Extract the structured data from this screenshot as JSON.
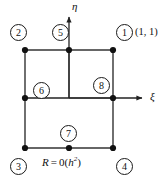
{
  "figure": {
    "name": "bilinear-quadrilateral-element-node-numbering",
    "canvas": {
      "width": 163,
      "height": 183
    },
    "colors": {
      "stroke": "#333333",
      "node_fill": "#111111",
      "circle_stroke": "#1a1a1a",
      "text": "#111111",
      "background": "#ffffff"
    },
    "axes": {
      "horizontal": {
        "label": "ξ",
        "name": "xi-axis",
        "y": 98,
        "x_start": 25,
        "x_end": 146,
        "label_x": 151,
        "label_y": 92
      },
      "vertical": {
        "label": "η",
        "name": "eta-axis",
        "x": 69,
        "y_start": 98,
        "y_end": 13,
        "label_x": 72,
        "label_y": 1
      }
    },
    "outer_square": {
      "left": 25,
      "top": 50,
      "right": 113,
      "bottom": 148
    },
    "inner_lines": {
      "vertical_segment": {
        "x": 69,
        "y_top": 50,
        "y_bottom": 98
      },
      "horizontal_segment": {
        "y": 98,
        "x_left": 69,
        "x_right": 113
      }
    },
    "nodes": [
      {
        "id": "1",
        "label": "1",
        "cx": 113,
        "cy": 50,
        "circle_x": 116,
        "circle_y": 24
      },
      {
        "id": "2",
        "label": "2",
        "cx": 25,
        "cy": 50,
        "circle_x": 10,
        "circle_y": 24
      },
      {
        "id": "3",
        "label": "3",
        "cx": 25,
        "cy": 148,
        "circle_x": 10,
        "circle_y": 158
      },
      {
        "id": "4",
        "label": "4",
        "cx": 113,
        "cy": 148,
        "circle_x": 116,
        "circle_y": 158
      },
      {
        "id": "5",
        "label": "5",
        "cx": 69,
        "cy": 50,
        "circle_x": 52,
        "circle_y": 24
      },
      {
        "id": "6",
        "label": "6",
        "cx": 25,
        "cy": 98,
        "circle_x": 33,
        "circle_y": 82
      },
      {
        "id": "7",
        "label": "7",
        "cx": 69,
        "cy": 148,
        "circle_x": 60,
        "circle_y": 125
      },
      {
        "id": "8",
        "label": "8",
        "cx": 113,
        "cy": 98,
        "circle_x": 93,
        "circle_y": 77
      }
    ],
    "annotations": {
      "corner_coordinate": {
        "text": "(1, 1)",
        "x": 136,
        "y": 26
      },
      "residual": {
        "symbol": "R",
        "equals": "=",
        "order_fn": "0",
        "open_paren": "(",
        "base": "h",
        "exponent": "2",
        "close_paren": ")",
        "full_text": "R = 0(h²)",
        "x": 42,
        "y": 156
      }
    }
  }
}
